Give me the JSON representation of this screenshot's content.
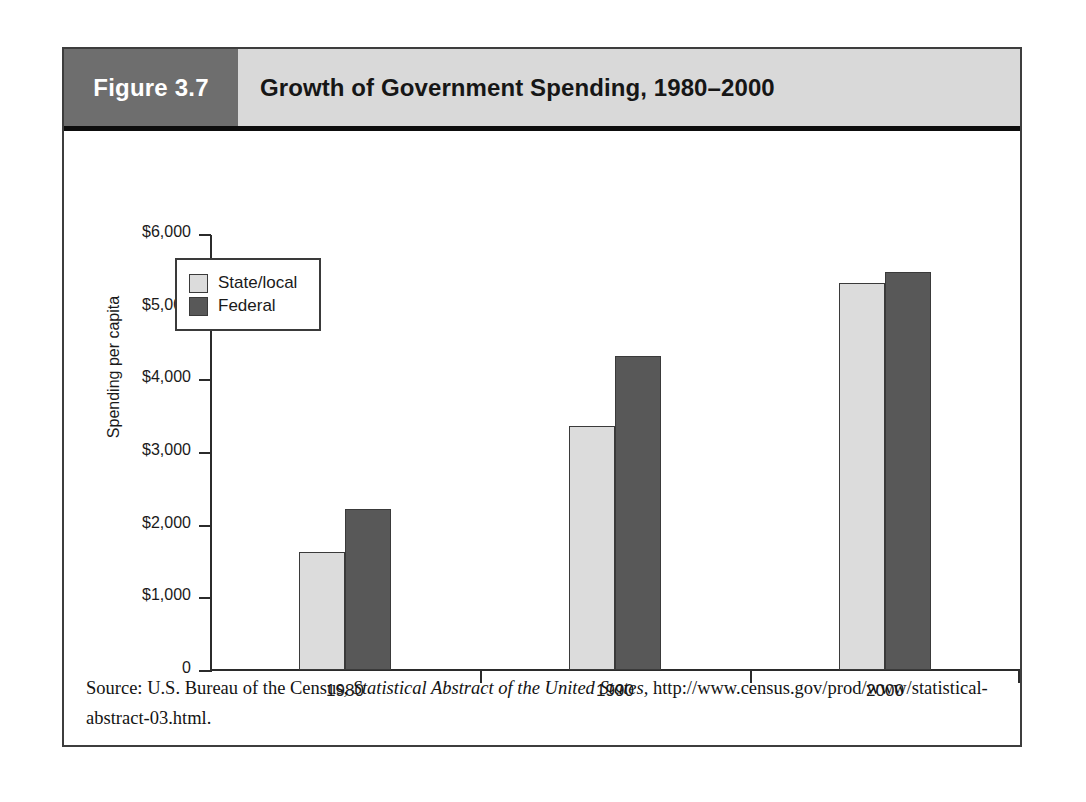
{
  "figure": {
    "number_label": "Figure 3.7",
    "title": "Growth of Government Spending, 1980–2000"
  },
  "source": {
    "prefix": "Source: U.S. Bureau of the Census, ",
    "italic_title": "Statistical Abstract of the United States,",
    "suffix": " http://www.census.gov/prod/www/statistical-abstract-03.html."
  },
  "colors": {
    "state_local": "#dcdcdc",
    "federal": "#585858",
    "header_number_block": "#6e6e6e",
    "header_title_block": "#d9d9d9",
    "frame": "#3d3d3d",
    "axis": "#2b2b2b"
  },
  "chart_data": {
    "type": "bar",
    "title": "Growth of Government Spending, 1980–2000",
    "xlabel": "",
    "ylabel": "Spending per capita",
    "categories": [
      "1980",
      "1990",
      "2000"
    ],
    "series": [
      {
        "name": "State/local",
        "values": [
          1620,
          3360,
          5330
        ],
        "color": "#dcdcdc"
      },
      {
        "name": "Federal",
        "values": [
          2220,
          4320,
          5480
        ],
        "color": "#585858"
      }
    ],
    "ylim": [
      0,
      6000
    ],
    "ytick_values": [
      6000,
      5000,
      4000,
      3000,
      2000,
      1000,
      0
    ],
    "ytick_labels": [
      "$6,000",
      "$5,000",
      "$4,000",
      "$3,000",
      "$2,000",
      "$1,000",
      "0"
    ],
    "grid": false,
    "legend_position": "upper-left-inside"
  }
}
